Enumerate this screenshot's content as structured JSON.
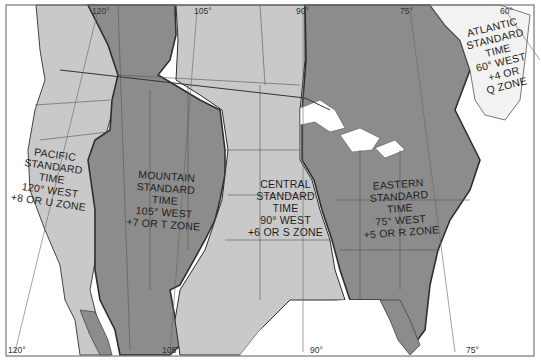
{
  "map": {
    "title": "North American Standard Time Zones",
    "colors": {
      "water": "#ffffff",
      "light_zone": "#c9c9c9",
      "dark_zone": "#8c8c8c",
      "border": "#333333",
      "frame": "#777777"
    },
    "zones": [
      {
        "name": "pacific",
        "lines": [
          "PACIFIC",
          "STANDARD",
          "TIME",
          "120° WEST",
          "+8 OR U ZONE"
        ]
      },
      {
        "name": "mountain",
        "lines": [
          "MOUNTAIN",
          "STANDARD",
          "TIME",
          "105° WEST",
          "+7 OR T ZONE"
        ]
      },
      {
        "name": "central",
        "lines": [
          "CENTRAL",
          "STANDARD",
          "TIME",
          "90° WEST",
          "+6 OR S ZONE"
        ]
      },
      {
        "name": "eastern",
        "lines": [
          "EASTERN",
          "STANDARD",
          "TIME",
          "75° WEST",
          "+5 OR R ZONE"
        ]
      },
      {
        "name": "atlantic",
        "lines": [
          "ATLANTIC",
          "STANDARD",
          "TIME",
          "60° WEST",
          "+4 OR",
          "Q ZONE"
        ]
      }
    ],
    "meridians_top": [
      "120°",
      "105°",
      "90°",
      "75°",
      "60°"
    ],
    "meridians_bottom": [
      "120°",
      "105°",
      "90°",
      "75°"
    ]
  }
}
